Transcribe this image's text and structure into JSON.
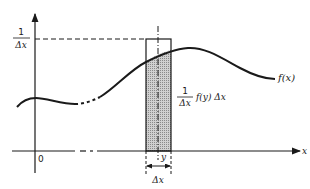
{
  "diagram": {
    "colors": {
      "line": "#1a1a1a",
      "shade": "#bdbdbd",
      "background": "#ffffff"
    },
    "axes": {
      "origin_label": "0",
      "x_axis_label": "x"
    },
    "labels": {
      "left_fraction_num": "1",
      "left_fraction_den": "Δx",
      "curve_label": "f(x)",
      "strip_fraction_num": "1",
      "strip_fraction_den": "Δx",
      "strip_expression": "f(y) Δx",
      "point_label": "y",
      "width_label": "Δx"
    }
  }
}
